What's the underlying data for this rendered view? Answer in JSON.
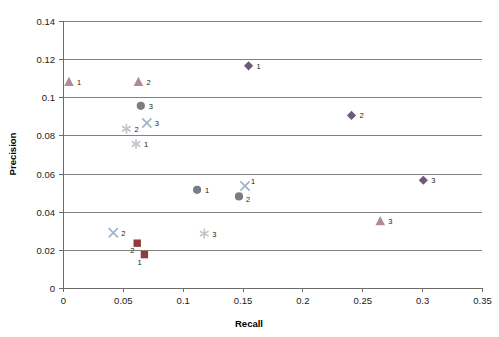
{
  "chart_data": {
    "type": "scatter",
    "title": "",
    "xlabel": "Recall",
    "ylabel": "Precision",
    "xlim": [
      0,
      0.35
    ],
    "ylim": [
      0,
      0.14
    ],
    "grid": "horizontal",
    "legend_position": "none",
    "xticks": [
      "0",
      "0.05",
      "0.1",
      "0.15",
      "0.2",
      "0.25",
      "0.3",
      "0.35"
    ],
    "xtick_values": [
      0,
      0.05,
      0.1,
      0.15,
      0.2,
      0.25,
      0.3,
      0.35
    ],
    "yticks": [
      "0",
      "0.02",
      "0.04",
      "0.06",
      "0.08",
      "0.1",
      "0.12",
      "0.14"
    ],
    "ytick_values": [
      0,
      0.02,
      0.04,
      0.06,
      0.08,
      0.1,
      0.12,
      0.14
    ],
    "series": [
      {
        "name": "triangle-series",
        "marker": "triangle",
        "color": "#b08a94",
        "points": [
          {
            "x": 0.005,
            "y": 0.108,
            "label": "1"
          },
          {
            "x": 0.063,
            "y": 0.108,
            "label": "2"
          },
          {
            "x": 0.265,
            "y": 0.035,
            "label": "3"
          }
        ]
      },
      {
        "name": "circle-series",
        "marker": "circle",
        "color": "#7c7c84",
        "points": [
          {
            "x": 0.065,
            "y": 0.0955,
            "label": "3"
          },
          {
            "x": 0.112,
            "y": 0.0515,
            "label": "1"
          },
          {
            "x": 0.147,
            "y": 0.048,
            "label": "2"
          }
        ]
      },
      {
        "name": "cross-series",
        "marker": "x",
        "color": "#9fb4cc",
        "points": [
          {
            "x": 0.07,
            "y": 0.0865,
            "label": "3"
          },
          {
            "x": 0.042,
            "y": 0.029,
            "label": "2"
          },
          {
            "x": 0.152,
            "y": 0.0535,
            "label": "1"
          }
        ]
      },
      {
        "name": "asterisk-series",
        "marker": "asterisk",
        "color": "#c2c2cc",
        "points": [
          {
            "x": 0.053,
            "y": 0.0835,
            "label": "2"
          },
          {
            "x": 0.061,
            "y": 0.0755,
            "label": "1"
          },
          {
            "x": 0.118,
            "y": 0.0285,
            "label": "3"
          }
        ]
      },
      {
        "name": "square-series",
        "marker": "square",
        "color": "#913c3c",
        "points": [
          {
            "x": 0.062,
            "y": 0.0235,
            "label": "2"
          },
          {
            "x": 0.068,
            "y": 0.0175,
            "label": "1"
          }
        ]
      },
      {
        "name": "diamond-series",
        "marker": "diamond",
        "color": "#6e5a78",
        "points": [
          {
            "x": 0.155,
            "y": 0.1165,
            "label": "1"
          },
          {
            "x": 0.241,
            "y": 0.0905,
            "label": "2"
          },
          {
            "x": 0.301,
            "y": 0.0565,
            "label": "3"
          }
        ]
      }
    ]
  },
  "axes": {
    "x_title": "Recall",
    "y_title": "Precision"
  }
}
